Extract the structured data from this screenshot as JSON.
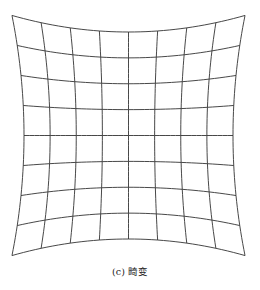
{
  "figure": {
    "caption": "(c) 畸变",
    "type": "pincushion-distorted-grid",
    "grid": {
      "columns": 8,
      "rows": 8,
      "line_color": "#333333",
      "center": [
        128.5,
        135.5
      ],
      "half_width": 104.5,
      "half_height": 103.5,
      "distortion_k_x": 0.115,
      "distortion_k_y": 0.16
    }
  }
}
